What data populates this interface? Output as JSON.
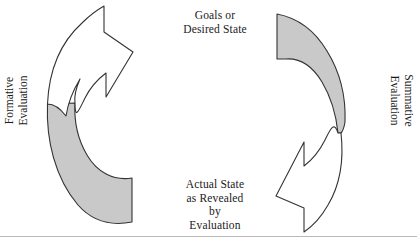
{
  "diagram": {
    "type": "cycle",
    "labels": {
      "top_center": "Goals or\nDesired State",
      "bottom_center": "Actual State\nas Revealed\nby\nEvaluation",
      "left_side": "Formative\nEvaluation",
      "right_side": "Summative\nEvaluation"
    },
    "arrows": [
      {
        "name": "formative-arrow-head",
        "fill": "#ffffff",
        "stroke": "#333333",
        "direction": "up-right",
        "position": "upper-left"
      },
      {
        "name": "formative-arrow-tail",
        "fill": "#c9c9c9",
        "stroke": "#333333",
        "direction": "curve",
        "position": "lower-left"
      },
      {
        "name": "summative-arrow-tail",
        "fill": "#c9c9c9",
        "stroke": "#333333",
        "direction": "curve",
        "position": "upper-right"
      },
      {
        "name": "summative-arrow-head",
        "fill": "#ffffff",
        "stroke": "#333333",
        "direction": "down-left",
        "position": "lower-right"
      }
    ],
    "colors": {
      "fill_gray": "#c9c9c9",
      "stroke": "#333333",
      "background": "#ffffff",
      "text": "#1a1a1a",
      "rule": "#b9b9b9"
    }
  }
}
